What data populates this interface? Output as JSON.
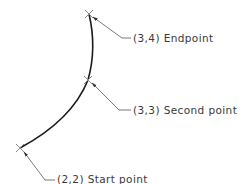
{
  "diagram": {
    "type": "three-point arc construction",
    "colors": {
      "arc": "#1a1a1a",
      "leader": "#6a6a6a",
      "marker": "#8a8a8a",
      "text": "#3a3a3a"
    },
    "arc": {
      "start": [
        20,
        148
      ],
      "through": [
        88,
        80
      ],
      "end": [
        89,
        14
      ]
    },
    "points": [
      {
        "id": "start",
        "label": "(2,2)  Start point",
        "marker": [
          20,
          148
        ],
        "knee": [
          45,
          180
        ],
        "text_pos": [
          57,
          184
        ]
      },
      {
        "id": "second",
        "label": "(3,3)  Second point",
        "marker": [
          88,
          80
        ],
        "knee": [
          119,
          110
        ],
        "text_pos": [
          133,
          114
        ]
      },
      {
        "id": "end",
        "label": "(3,4)  Endpoint",
        "marker": [
          89,
          14
        ],
        "knee": [
          122,
          38
        ],
        "text_pos": [
          133,
          42
        ]
      }
    ]
  }
}
